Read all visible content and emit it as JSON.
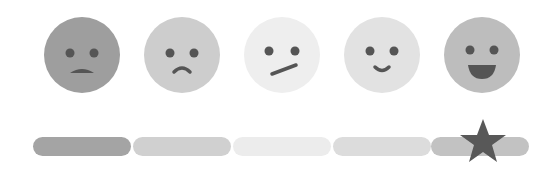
{
  "rating": {
    "selected_index": 4,
    "selected_label": "Very satisfied",
    "options": [
      {
        "label": "Very dissatisfied",
        "icon": "angry-face-icon",
        "face_color": "#9e9e9e",
        "bar_color": "#a4a4a4"
      },
      {
        "label": "Dissatisfied",
        "icon": "sad-face-icon",
        "face_color": "#cdcdcd",
        "bar_color": "#d0d0d0"
      },
      {
        "label": "Neutral",
        "icon": "neutral-face-icon",
        "face_color": "#eeeeee",
        "bar_color": "#ececec"
      },
      {
        "label": "Satisfied",
        "icon": "smile-face-icon",
        "face_color": "#e2e2e2",
        "bar_color": "#dcdcdc"
      },
      {
        "label": "Very satisfied",
        "icon": "happy-face-icon",
        "face_color": "#bdbdbd",
        "bar_color": "#c2c2c2"
      }
    ],
    "feature_color": "#555555",
    "marker_icon": "star-icon",
    "marker_color": "#585858"
  }
}
